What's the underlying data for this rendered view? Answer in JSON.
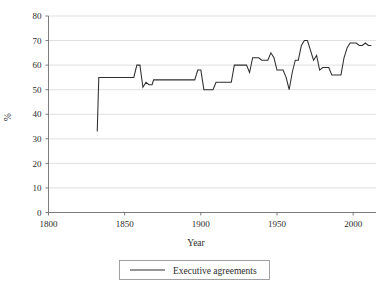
{
  "chart_data": {
    "type": "line",
    "title": "",
    "xlabel": "Year",
    "ylabel": "%",
    "xlim": [
      1800,
      2015
    ],
    "ylim": [
      0,
      80
    ],
    "xticks": [
      1800,
      1850,
      1900,
      1950,
      2000
    ],
    "yticks": [
      0,
      10,
      20,
      30,
      40,
      50,
      60,
      70,
      80
    ],
    "grid": true,
    "legend_position": "bottom-center",
    "series": [
      {
        "name": "Executive agreements",
        "color": "#2e2e2e",
        "x": [
          1832,
          1833,
          1836,
          1840,
          1844,
          1845,
          1846,
          1848,
          1850,
          1852,
          1854,
          1856,
          1858,
          1860,
          1862,
          1864,
          1866,
          1868,
          1869,
          1870,
          1872,
          1874,
          1876,
          1878,
          1880,
          1882,
          1884,
          1886,
          1888,
          1890,
          1892,
          1894,
          1896,
          1898,
          1900,
          1902,
          1904,
          1906,
          1908,
          1910,
          1912,
          1914,
          1916,
          1918,
          1920,
          1922,
          1924,
          1926,
          1928,
          1930,
          1932,
          1934,
          1936,
          1938,
          1940,
          1942,
          1944,
          1946,
          1948,
          1950,
          1952,
          1954,
          1956,
          1958,
          1960,
          1962,
          1964,
          1966,
          1968,
          1970,
          1972,
          1974,
          1976,
          1978,
          1980,
          1982,
          1984,
          1986,
          1988,
          1990,
          1992,
          1994,
          1996,
          1998,
          2000,
          2002,
          2004,
          2006,
          2008,
          2010,
          2012
        ],
        "y": [
          33,
          55,
          55,
          55,
          55,
          55,
          55,
          55,
          55,
          55,
          55,
          55,
          60,
          60,
          51,
          53,
          52,
          52,
          54,
          54,
          54,
          54,
          54,
          54,
          54,
          54,
          54,
          54,
          54,
          54,
          54,
          54,
          54,
          58,
          58,
          50,
          50,
          50,
          50,
          53,
          53,
          53,
          53,
          53,
          53,
          60,
          60,
          60,
          60,
          60,
          57,
          63,
          63,
          63,
          62,
          62,
          62,
          65,
          63,
          58,
          58,
          58,
          55,
          50,
          57,
          62,
          62,
          68,
          70,
          70,
          66,
          62,
          64,
          58,
          59,
          59,
          59,
          56,
          56,
          56,
          56,
          63,
          67,
          69,
          69,
          69,
          68,
          68,
          69,
          68,
          68
        ]
      }
    ]
  },
  "legend": {
    "entries": [
      {
        "label": "Executive agreements"
      }
    ]
  },
  "axes": {
    "x_title": "Year",
    "y_title": "%",
    "x_tick_labels": [
      "1800",
      "1850",
      "1900",
      "1950",
      "2000"
    ],
    "y_tick_labels": [
      "0",
      "10",
      "20",
      "30",
      "40",
      "50",
      "60",
      "70",
      "80"
    ]
  }
}
